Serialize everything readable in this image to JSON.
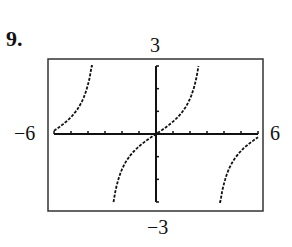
{
  "problem_number": "9.",
  "labels": {
    "ymax": "3",
    "ymin": "−3",
    "xmin": "−6",
    "xmax": "6"
  },
  "chart_data": {
    "type": "line",
    "title": "",
    "xlabel": "",
    "ylabel": "",
    "xlim": [
      -6,
      6
    ],
    "ylim": [
      -3,
      3
    ],
    "x_ticks_step": 1,
    "y_ticks_step": 1,
    "grid": false,
    "function_estimate": "y = tan(x/2)",
    "asymptotes_x": [
      -3.14,
      3.14
    ],
    "series": [
      {
        "name": "left branch",
        "x": [
          -6,
          -5.5,
          -5,
          -4.5,
          -4,
          -3.7
        ],
        "y": [
          0.14,
          0.4,
          0.75,
          1.24,
          2.19,
          3.0
        ]
      },
      {
        "name": "middle branch",
        "x": [
          -2.5,
          -2,
          -1,
          0,
          1,
          2,
          2.5
        ],
        "y": [
          -3.0,
          -1.56,
          -0.55,
          0,
          0.55,
          1.56,
          3.0
        ]
      },
      {
        "name": "right branch",
        "x": [
          3.7,
          4,
          4.5,
          5,
          5.5,
          6
        ],
        "y": [
          -3.0,
          -2.19,
          -1.24,
          -0.75,
          -0.4,
          -0.14
        ]
      }
    ]
  }
}
